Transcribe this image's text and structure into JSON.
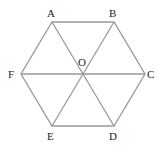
{
  "diagram": {
    "line_color": "#9a9a9a",
    "label_color": "#222222",
    "vertices": {
      "A": {
        "label": "A",
        "x": 52,
        "y": 22
      },
      "B": {
        "label": "B",
        "x": 114,
        "y": 22
      },
      "C": {
        "label": "C",
        "x": 145,
        "y": 74
      },
      "D": {
        "label": "D",
        "x": 114,
        "y": 126
      },
      "E": {
        "label": "E",
        "x": 52,
        "y": 126
      },
      "F": {
        "label": "F",
        "x": 21,
        "y": 74
      },
      "O": {
        "label": "O",
        "x": 83,
        "y": 74
      }
    },
    "edges": [
      [
        "A",
        "B"
      ],
      [
        "B",
        "C"
      ],
      [
        "C",
        "D"
      ],
      [
        "D",
        "E"
      ],
      [
        "E",
        "F"
      ],
      [
        "F",
        "A"
      ],
      [
        "A",
        "D"
      ],
      [
        "B",
        "E"
      ],
      [
        "F",
        "C"
      ]
    ]
  }
}
